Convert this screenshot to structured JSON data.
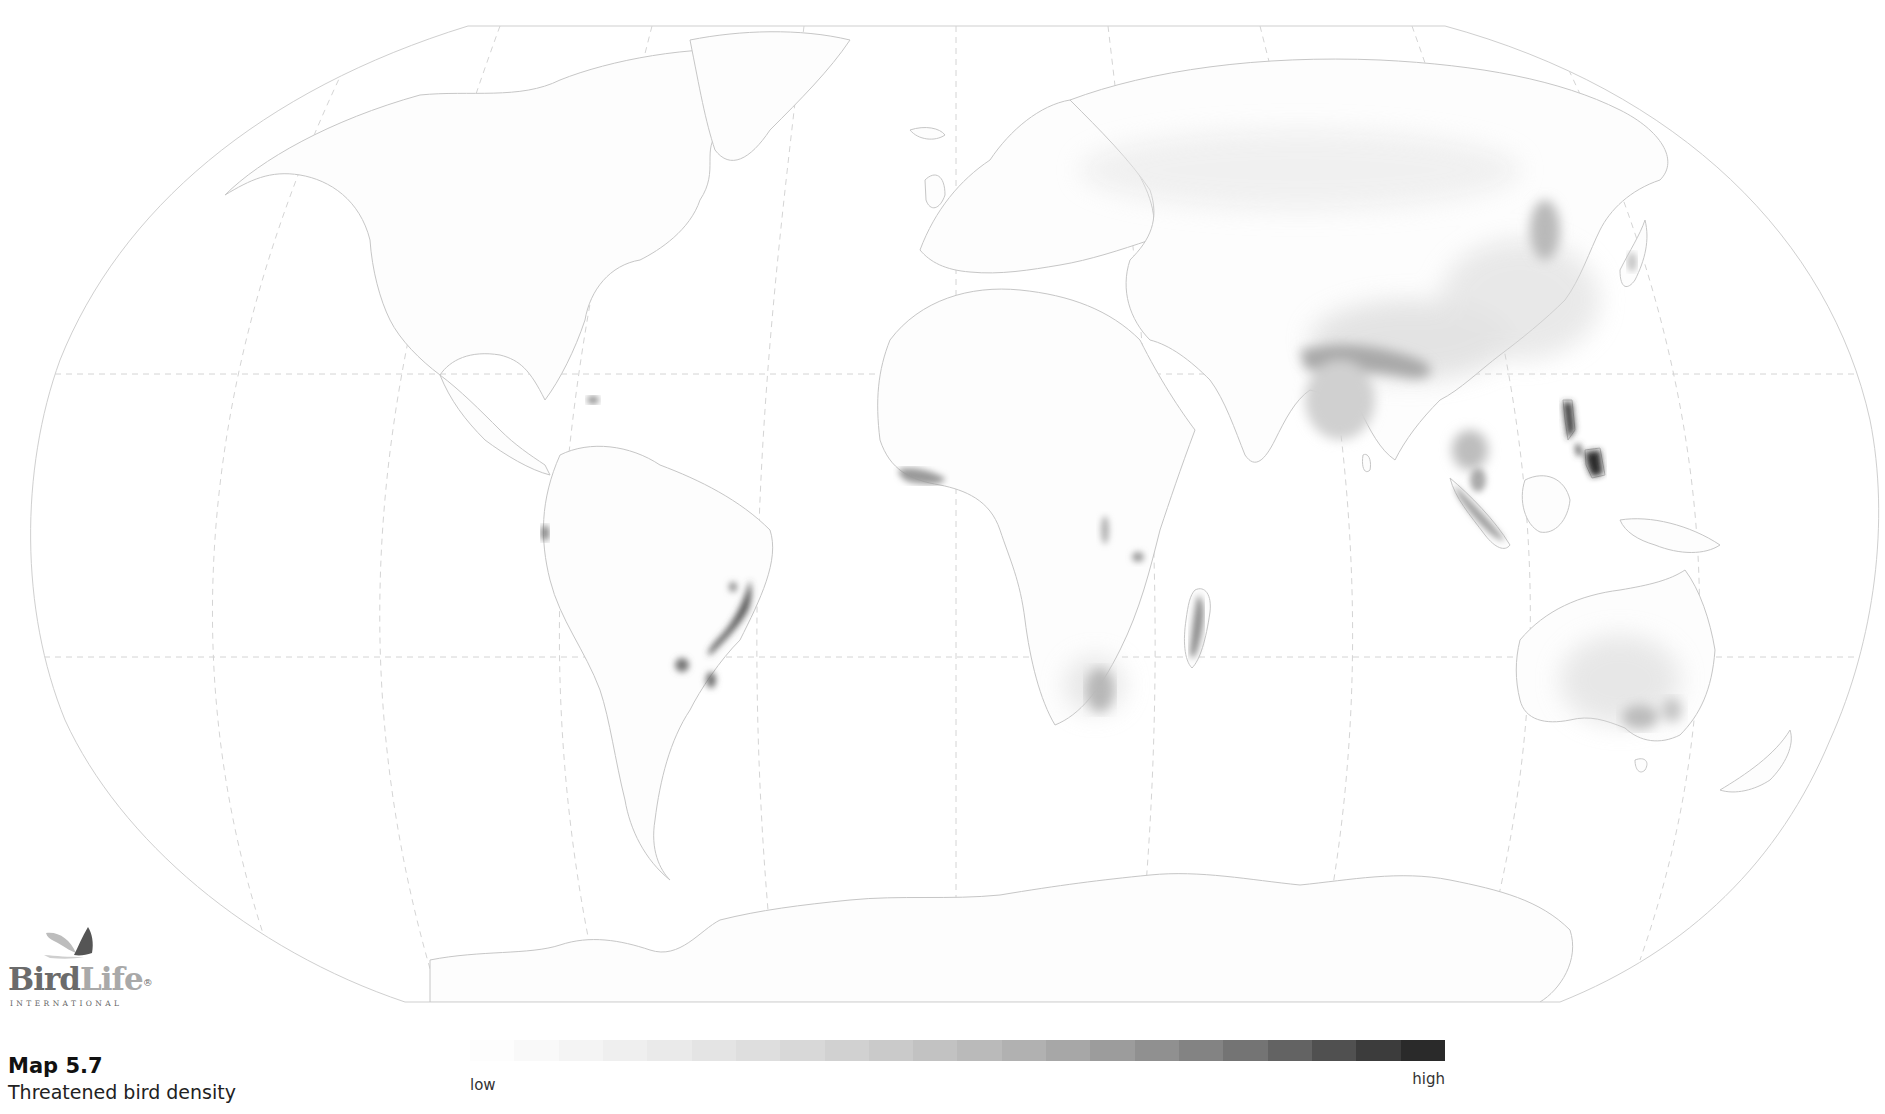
{
  "caption": {
    "title": "Map 5.7",
    "subtitle": "Threatened bird density"
  },
  "logo": {
    "word_bird": "Bird",
    "word_life": "Life",
    "registered": "®",
    "subtitle": "INTERNATIONAL"
  },
  "legend": {
    "low_label": "low",
    "high_label": "high",
    "steps": [
      "#fdfdfd",
      "#f9f9f9",
      "#f4f4f4",
      "#efefef",
      "#eaeaea",
      "#e4e4e4",
      "#dedede",
      "#d8d8d8",
      "#d1d1d1",
      "#cacaca",
      "#c2c2c2",
      "#bababa",
      "#b1b1b1",
      "#a7a7a7",
      "#9c9c9c",
      "#909090",
      "#838383",
      "#747474",
      "#636363",
      "#505050",
      "#3c3c3c",
      "#2a2a2a"
    ]
  },
  "map": {
    "projection": "Robinson",
    "background": "#ffffff",
    "outline_color": "#c8c8c8",
    "graticule_color": "#cfcfcf",
    "hotspots": [
      {
        "region": "Philippines (Luzon)",
        "intensity": "very high"
      },
      {
        "region": "Philippines (Mindanao)",
        "intensity": "very high"
      },
      {
        "region": "Atlantic Forest, Brazil",
        "intensity": "high"
      },
      {
        "region": "Madagascar",
        "intensity": "medium-high"
      },
      {
        "region": "Sumatra",
        "intensity": "medium"
      },
      {
        "region": "Himalaya / NE India",
        "intensity": "medium"
      },
      {
        "region": "Upper Guinea forests, West Africa",
        "intensity": "medium"
      },
      {
        "region": "Eastern Arc, Tanzania",
        "intensity": "medium"
      },
      {
        "region": "Albertine Rift",
        "intensity": "medium"
      },
      {
        "region": "Andes, Ecuador",
        "intensity": "medium"
      },
      {
        "region": "Hispaniola",
        "intensity": "medium"
      },
      {
        "region": "South-east Australia",
        "intensity": "low-medium"
      },
      {
        "region": "South Africa (east)",
        "intensity": "low-medium"
      },
      {
        "region": "Eastern China",
        "intensity": "low"
      },
      {
        "region": "Malay Peninsula",
        "intensity": "medium"
      }
    ]
  }
}
